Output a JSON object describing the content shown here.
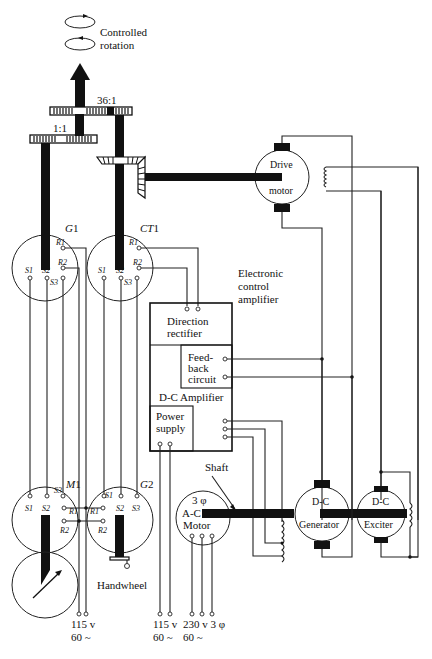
{
  "figure": {
    "output": {
      "label_line1": "Controlled",
      "label_line2": "rotation"
    },
    "gears": {
      "coarse_ratio": "1:1",
      "fine_ratio": "36:1"
    },
    "synchros": {
      "G1": {
        "name": "G",
        "num": "1",
        "terminals": [
          "R1",
          "R2",
          "S1",
          "S2",
          "S3"
        ]
      },
      "CT1": {
        "name": "CT",
        "num": "1",
        "terminals": [
          "R1",
          "R2",
          "S1",
          "S2",
          "S3"
        ]
      },
      "M1": {
        "name": "M",
        "num": "1",
        "terminals": [
          "S1",
          "S2",
          "S3",
          "R1",
          "R2"
        ]
      },
      "G2": {
        "name": "G",
        "num": "2",
        "terminals": [
          "S1",
          "S2",
          "S3",
          "R1",
          "R2"
        ]
      }
    },
    "amplifier": {
      "title_line1": "Electronic",
      "title_line2": "control",
      "title_line3": "amplifier",
      "direction_rectifier_line1": "Direction",
      "direction_rectifier_line2": "rectifier",
      "feedback_line1": "Feed-",
      "feedback_line2": "back",
      "feedback_line3": "circuit",
      "dc_amplifier": "D-C Amplifier",
      "power_supply_line1": "Power",
      "power_supply_line2": "supply"
    },
    "machines": {
      "drive_motor_line1": "Drive",
      "drive_motor_line2": "motor",
      "ac_motor_phase": "3 φ",
      "ac_motor_line1": "A-C",
      "ac_motor_line2": "Motor",
      "dc_generator_line1": "D-C",
      "dc_generator_line2": "Generator",
      "dc_exciter_line1": "D-C",
      "dc_exciter_line2": "Exciter",
      "shaft_label": "Shaft"
    },
    "handwheel_label": "Handwheel",
    "supplies": [
      {
        "voltage": "115 v",
        "freq": "60 ~"
      },
      {
        "voltage": "115 v",
        "freq": "60 ~"
      },
      {
        "voltage": "230 v 3 φ",
        "freq": "60 ~"
      }
    ],
    "icons": {
      "rotation": "rotation-arrows-icon",
      "dial": "indicator-dial-icon",
      "handwheel": "handwheel-icon",
      "coil": "field-coil-icon"
    }
  }
}
